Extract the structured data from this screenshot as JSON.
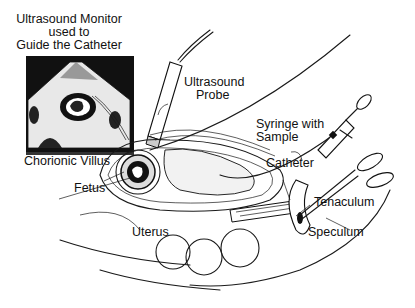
{
  "figure": {
    "monitor_caption": [
      "Ultrasound Monitor",
      "used to",
      "Guide the Catheter"
    ],
    "labels": {
      "ultrasound_probe": [
        "Ultrasound",
        "Probe"
      ],
      "syringe": [
        "Syringe with",
        "Sample"
      ],
      "catheter": "Catheter",
      "chorionic_villus": "Chorionic Villus",
      "fetus": "Fetus",
      "tenaculum": "Tenaculum",
      "uterus": "Uterus",
      "speculum": "Speculum"
    },
    "colors": {
      "ink": "#111111",
      "background": "#ffffff"
    }
  }
}
